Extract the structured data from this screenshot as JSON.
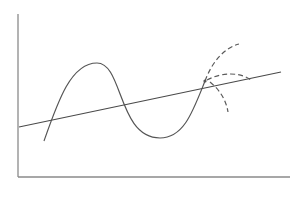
{
  "figure": {
    "colors": {
      "axis": "#8a8a8a",
      "curve": "#555555",
      "line": "#4a4a4a",
      "dashed": "#5a5a5a",
      "background": "#ffffff"
    },
    "axes": {
      "y_axis": {
        "x": 18,
        "y_top": 14,
        "y_bottom": 177
      },
      "x_axis": {
        "y": 177,
        "x_left": 18,
        "x_right": 290
      }
    },
    "straight_line": {
      "x1": 19,
      "y1": 127,
      "x2": 281,
      "y2": 72
    },
    "wave_curve": {
      "start": [
        44,
        141
      ],
      "peak": [
        97,
        63
      ],
      "trough": [
        160,
        138
      ],
      "end": [
        205,
        81
      ]
    },
    "junction_point": {
      "x": 205,
      "y": 81,
      "r": 1.6
    },
    "dashed_arcs": [
      {
        "name": "upward-branch",
        "path": "M205,81 C212,62 224,48 239,44"
      },
      {
        "name": "horizontal-branch",
        "path": "M207,80 C222,72 240,72 251,80"
      },
      {
        "name": "downward-branch",
        "path": "M210,82 C220,90 226,100 228,112"
      }
    ]
  }
}
